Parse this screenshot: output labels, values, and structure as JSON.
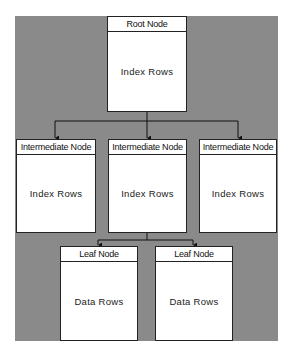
{
  "diagram": {
    "background_color": "#8a8a8a",
    "root": {
      "header": "Root Node",
      "body": "Index Rows"
    },
    "intermediate": [
      {
        "header": "Intermediate Node",
        "body": "Index Rows"
      },
      {
        "header": "Intermediate Node",
        "body": "Index Rows"
      },
      {
        "header": "Intermediate Node",
        "body": "Index Rows"
      }
    ],
    "leaves": [
      {
        "header": "Leaf Node",
        "body": "Data Rows"
      },
      {
        "header": "Leaf Node",
        "body": "Data Rows"
      }
    ],
    "edges": [
      {
        "from": "root",
        "to": "intermediate.0"
      },
      {
        "from": "root",
        "to": "intermediate.1"
      },
      {
        "from": "root",
        "to": "intermediate.2"
      },
      {
        "from": "intermediate.1",
        "to": "leaves.0"
      },
      {
        "from": "intermediate.1",
        "to": "leaves.1"
      }
    ]
  }
}
